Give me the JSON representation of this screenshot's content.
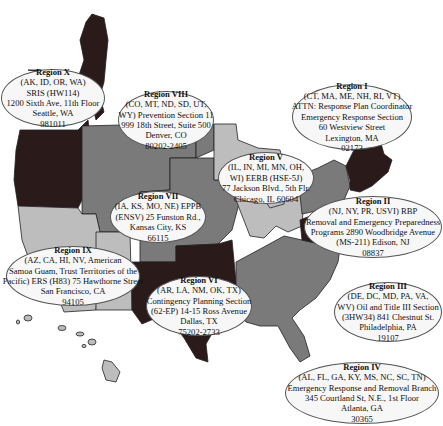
{
  "map": {
    "colors": {
      "dark": "#2a1a1a",
      "medium": "#7a7a7a",
      "light": "#bdbdbd",
      "border": "#222222",
      "callout_bg": "#f7f7f7"
    }
  },
  "regions": [
    {
      "id": "region-x",
      "title": "Region X",
      "lines": [
        "(AK, ID, OR, WA)",
        "SRIS (HW114)",
        "1200 Sixth Ave, 11th Floor",
        "Seattle, WA",
        "981011"
      ]
    },
    {
      "id": "region-viii",
      "title": "Region VIII",
      "lines": [
        "(CO, MT, ND, SD, UT,",
        "WY) Prevention Section 11",
        "999 18th Street, Suite 500",
        "Denver, CO",
        "80202-2405"
      ]
    },
    {
      "id": "region-i",
      "title": "Region I",
      "lines": [
        "(CT, MA, ME, NH, RI, VT)",
        "ATTN: Response Plan Coordinator",
        "Emergency Response Section",
        "60 Westview Street",
        "Lexington, MA",
        "02173"
      ]
    },
    {
      "id": "region-v",
      "title": "Region V",
      "lines": [
        "(IL, IN, MI, MN, OH,",
        "WI) EERB (HSE-5J)",
        "77 Jackson Blvd., 5th Flr.",
        "Chicago, IL 60604"
      ]
    },
    {
      "id": "region-vii",
      "title": "Region VII",
      "lines": [
        "(IA, KS, MO, NE) EPPB",
        "(ENSV) 25 Funston Rd.,",
        "Kansas City, KS",
        "66115"
      ]
    },
    {
      "id": "region-ii",
      "title": "Region II",
      "lines": [
        "(NJ, NY, PR, USVI) RBP",
        "Removal and Emergency Preparedness",
        "Programs 2890 Woodbridge Avenue",
        "(MS-211) Edison, NJ",
        "08837"
      ]
    },
    {
      "id": "region-ix",
      "title": "Region IX",
      "lines": [
        "(AZ, CA, HI, NV, American",
        "Samoa Guam, Trust Territories of the",
        "Pacific) ERS (H83) 75 Hawthorne Street",
        "San Francisco, CA",
        "94105"
      ]
    },
    {
      "id": "region-vi",
      "title": "Region VI",
      "lines": [
        "(AR, LA, NM, OK, TX)",
        "Contingency Planning Section",
        "(62-EP) 14-15 Ross Avenue",
        "Dallas, TX",
        "75202-2733"
      ]
    },
    {
      "id": "region-iii",
      "title": "Region III",
      "lines": [
        "(DE, DC, MD, PA, VA,",
        "WV) Oil and Title III Section",
        "(3HW34) 841 Chestnut St.",
        "Philadelphia, PA",
        "19107"
      ]
    },
    {
      "id": "region-iv",
      "title": "Region IV",
      "lines": [
        "(AL, FL, GA, KY, MS, NC, SC, TN)",
        "Emergency Response and Removal Branch",
        "345 Courtland St, N.E., 1st Floor",
        "Atlanta, GA",
        "30365"
      ]
    }
  ]
}
